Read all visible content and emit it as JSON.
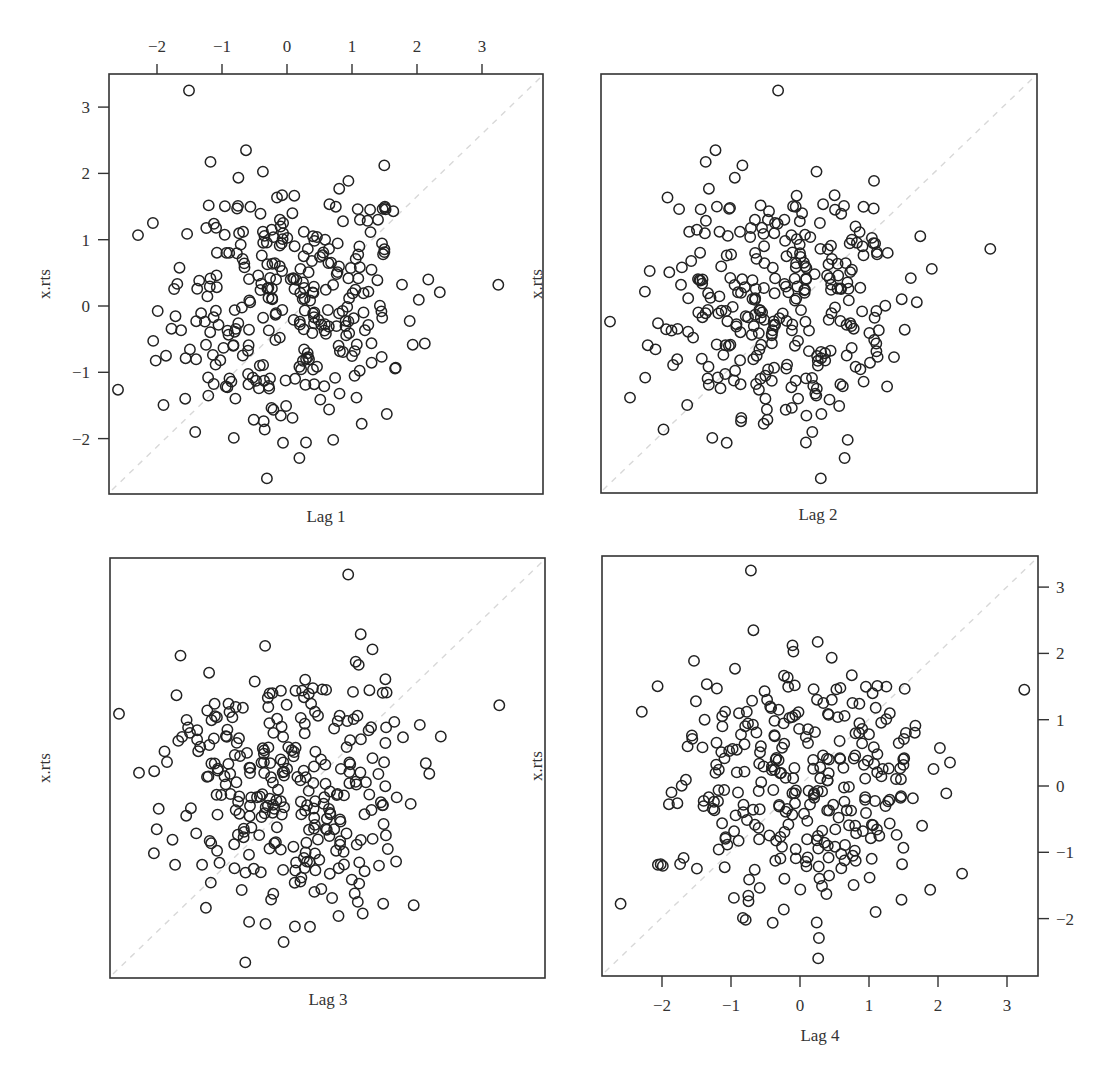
{
  "chart_data": {
    "type": "scatter",
    "title": "",
    "layout": "2x2 lag plot matrix",
    "series_name": "x.rts",
    "ylabel": "x.rts",
    "axis_ticks": [
      -2,
      -1,
      0,
      1,
      2,
      3
    ],
    "tick_labels": [
      "−2",
      "−1",
      "0",
      "1",
      "2",
      "3"
    ],
    "xlim": [
      -2.75,
      3.95
    ],
    "ylim": [
      -2.85,
      3.45
    ],
    "grid": false,
    "reference_line": "y = x (light dashed diagonal)",
    "marker": "open circle",
    "panels": [
      {
        "name": "Lag 1",
        "xlabel": "Lag 1",
        "ylabel": "x.rts",
        "top_axis": true,
        "left_axis": true,
        "right_axis": false,
        "bottom_axis": false
      },
      {
        "name": "Lag 2",
        "xlabel": "Lag 2",
        "ylabel": "x.rts",
        "top_axis": false,
        "left_axis": false,
        "right_axis": false,
        "bottom_axis": false
      },
      {
        "name": "Lag 3",
        "xlabel": "Lag 3",
        "ylabel": "x.rts",
        "top_axis": false,
        "left_axis": false,
        "right_axis": false,
        "bottom_axis": false
      },
      {
        "name": "Lag 4",
        "xlabel": "Lag 4",
        "ylabel": "x.rts",
        "top_axis": false,
        "left_axis": false,
        "right_axis": true,
        "bottom_axis": true
      }
    ]
  },
  "labels": {
    "ylabel": "x.rts",
    "lag1": "Lag 1",
    "lag2": "Lag 2",
    "lag3": "Lag 3",
    "lag4": "Lag 4"
  }
}
